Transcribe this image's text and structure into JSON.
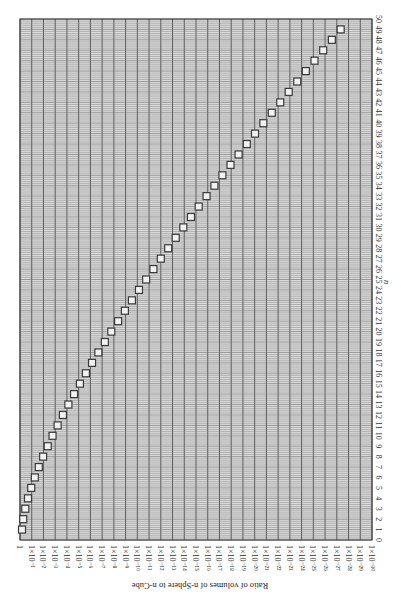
{
  "chart_data": {
    "type": "scatter",
    "title": "",
    "orientation": "rotated-90-clockwise",
    "xlabel": "n",
    "ylabel": "Ratio of volumes of n-Sphere to n-Cube",
    "x_axis": {
      "label": "n",
      "range": [
        0,
        50
      ],
      "ticks": [
        0,
        1,
        2,
        3,
        4,
        5,
        6,
        7,
        8,
        9,
        10,
        11,
        12,
        13,
        14,
        15,
        16,
        17,
        18,
        19,
        20,
        21,
        22,
        23,
        24,
        25,
        26,
        27,
        28,
        29,
        30,
        31,
        32,
        33,
        34,
        35,
        36,
        37,
        38,
        39,
        40,
        41,
        42,
        43,
        44,
        45,
        46,
        47,
        48,
        49,
        50
      ]
    },
    "y_axis": {
      "label": "Ratio of volumes of n-Sphere to n-Cube",
      "scale": "log",
      "range_log10": [
        -30,
        0
      ],
      "tick_labels": [
        "1",
        "1×10⁻¹",
        "1×10⁻²",
        "1×10⁻³",
        "1×10⁻⁴",
        "1×10⁻⁵",
        "1×10⁻⁶",
        "1×10⁻⁷",
        "1×10⁻⁸",
        "1×10⁻⁹",
        "1×10⁻¹⁰",
        "1×10⁻¹¹",
        "1×10⁻¹²",
        "1×10⁻¹³",
        "1×10⁻¹⁴",
        "1×10⁻¹⁵",
        "1×10⁻¹⁶",
        "1×10⁻¹⁷",
        "1×10⁻¹⁸",
        "1×10⁻¹⁹",
        "1×10⁻²⁰",
        "1×10⁻²¹",
        "1×10⁻²²",
        "1×10⁻²³",
        "1×10⁻²⁴",
        "1×10⁻²⁵",
        "1×10⁻²⁶",
        "1×10⁻²⁷",
        "1×10⁻²⁸",
        "1×10⁻²⁹",
        "1×10⁻³⁰"
      ]
    },
    "grid": true,
    "legend": null,
    "marker": "square",
    "series": [
      {
        "name": "Ratio of volumes of n-Sphere to n-Cube",
        "x": [
          1,
          2,
          3,
          4,
          5,
          6,
          7,
          8,
          9,
          10,
          11,
          12,
          13,
          14,
          15,
          16,
          17,
          18,
          19,
          20,
          21,
          22,
          23,
          24,
          25,
          26,
          27,
          28,
          29,
          30,
          31,
          32,
          33,
          34,
          35,
          36,
          37,
          38,
          39,
          40,
          41,
          42,
          43,
          44,
          45,
          46,
          47,
          48,
          49
        ],
        "log10_values": [
          0,
          -0.105,
          -0.281,
          -0.511,
          -0.784,
          -1.093,
          -1.433,
          -1.8,
          -2.191,
          -2.604,
          -3.036,
          -3.487,
          -3.955,
          -4.437,
          -4.935,
          -5.445,
          -5.969,
          -6.508,
          -7.06,
          -7.61,
          -8.19,
          -8.77,
          -9.37,
          -9.97,
          -10.58,
          -11.2,
          -11.83,
          -12.46,
          -13.1,
          -13.75,
          -14.4,
          -15.06,
          -15.73,
          -16.4,
          -17.08,
          -17.77,
          -18.46,
          -19.16,
          -19.86,
          -20.57,
          -21.29,
          -22.01,
          -22.73,
          -23.46,
          -24.19,
          -24.93,
          -25.67,
          -26.41,
          -27.16
        ],
        "values": [
          1,
          0.785,
          0.524,
          0.308,
          0.164,
          0.0807,
          0.0369,
          0.0159,
          0.00644,
          0.00249,
          0.00092,
          0.000326,
          0.000111,
          3.66e-05,
          1.16e-05,
          3.59e-06,
          1.07e-06,
          3.1e-07,
          8.7e-08,
          2.46e-08,
          6.5e-09,
          1.7e-09,
          4.3e-10,
          1.1e-10,
          2.6e-11,
          6.3e-12,
          1.5e-12,
          3.5e-13,
          8e-14,
          1.8e-14,
          4e-15,
          8.7e-16,
          1.9e-16,
          4e-17,
          8.3e-18,
          1.7e-18,
          3.4e-19,
          6.8e-20,
          1.3e-20,
          2.6e-21,
          5.1e-22,
          9.8e-23,
          1.9e-23,
          3.5e-24,
          6.5e-25,
          1.2e-25,
          2.2e-26,
          3.9e-27,
          7e-28
        ]
      }
    ]
  },
  "colors": {
    "background": "#ffffff",
    "plot_fill": "#d9d9d9",
    "grid_major": "#555555",
    "grid_minor": "#8a8a8a",
    "frame": "#333333",
    "marker_fill": "#f2f2f2",
    "marker_stroke": "#3a3a3a"
  }
}
